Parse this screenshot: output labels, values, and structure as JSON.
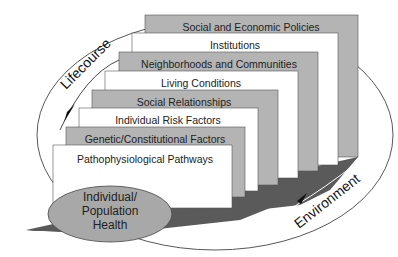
{
  "diagram": {
    "type": "layered-determinants-of-health",
    "colors": {
      "gray_panel": "#b4b4b4",
      "white_panel": "#ffffff",
      "floor": "#5a5a5a",
      "oval_fill": "#a8a8a8",
      "stroke": "#333333"
    },
    "layers": [
      {
        "label": "Social and Economic Policies",
        "fill": "gray"
      },
      {
        "label": "Institutions",
        "fill": "white"
      },
      {
        "label": "Neighborhoods and Communities",
        "fill": "gray"
      },
      {
        "label": "Living Conditions",
        "fill": "white"
      },
      {
        "label": "Social Relationships",
        "fill": "gray"
      },
      {
        "label": "Individual Risk Factors",
        "fill": "white"
      },
      {
        "label": "Genetic/Constitutional Factors",
        "fill": "gray"
      },
      {
        "label": "Pathophysiological Pathways",
        "fill": "white"
      }
    ],
    "center": {
      "line1": "Individual/",
      "line2": "Population",
      "line3": "Health"
    },
    "arrows": {
      "lifecourse": "Lifecourse",
      "environment": "Environment"
    }
  }
}
